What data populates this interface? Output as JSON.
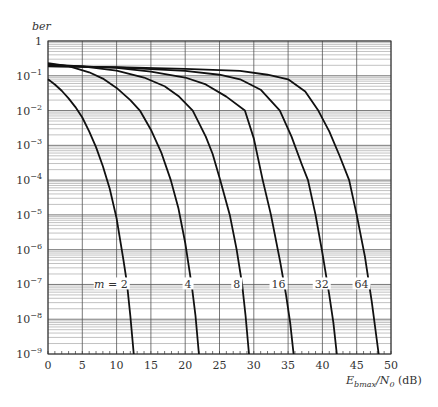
{
  "chart_data": {
    "type": "line",
    "title": "",
    "xlabel": "E_bmax/N_0 (dB)",
    "ylabel": "ber",
    "xscale": "linear",
    "yscale": "log",
    "xlim": [
      0,
      50
    ],
    "ylim": [
      1e-09,
      1
    ],
    "grid": true,
    "x_ticks": [
      0,
      5,
      10,
      15,
      20,
      25,
      30,
      35,
      40,
      45,
      50
    ],
    "y_ticks": [
      "1",
      "10^-1",
      "10^-2",
      "10^-3",
      "10^-4",
      "10^-5",
      "10^-6",
      "10^-7",
      "10^-8",
      "10^-9"
    ],
    "legend": "inline labels at ber = 10^-7",
    "series": [
      {
        "name": "m = 2",
        "label": "m = 2",
        "label_x": 12.5,
        "points": [
          [
            0,
            -1.1
          ],
          [
            1,
            -1.25
          ],
          [
            2,
            -1.43
          ],
          [
            3,
            -1.65
          ],
          [
            4,
            -1.9
          ],
          [
            5,
            -2.2
          ],
          [
            6,
            -2.6
          ],
          [
            7,
            -3.05
          ],
          [
            8,
            -3.6
          ],
          [
            9,
            -4.25
          ],
          [
            10,
            -5.1
          ],
          [
            11,
            -6.3
          ],
          [
            11.5,
            -6.95
          ],
          [
            12,
            -7.9
          ],
          [
            12.5,
            -9
          ]
        ]
      },
      {
        "name": "m = 4",
        "label": "4",
        "label_x": 21.8,
        "points": [
          [
            0,
            -0.64
          ],
          [
            3,
            -0.72
          ],
          [
            6,
            -0.9
          ],
          [
            8,
            -1.08
          ],
          [
            10,
            -1.35
          ],
          [
            12,
            -1.7
          ],
          [
            13.4,
            -2.0
          ],
          [
            15,
            -2.55
          ],
          [
            16.5,
            -3.2
          ],
          [
            17.9,
            -4.0
          ],
          [
            19,
            -4.8
          ],
          [
            20,
            -5.8
          ],
          [
            21,
            -7.1
          ],
          [
            21.5,
            -7.9
          ],
          [
            22,
            -9
          ]
        ]
      },
      {
        "name": "m = 8",
        "label": "8",
        "label_x": 28.9,
        "points": [
          [
            0,
            -0.67
          ],
          [
            5,
            -0.73
          ],
          [
            10,
            -0.85
          ],
          [
            14,
            -1.05
          ],
          [
            17,
            -1.3
          ],
          [
            19,
            -1.58
          ],
          [
            21.1,
            -2.0
          ],
          [
            23,
            -2.75
          ],
          [
            24,
            -3.25
          ],
          [
            25.1,
            -4.0
          ],
          [
            26.5,
            -5.0
          ],
          [
            27.5,
            -6.0
          ],
          [
            28.3,
            -7.0
          ],
          [
            28.8,
            -7.9
          ],
          [
            29.3,
            -9
          ]
        ]
      },
      {
        "name": "m = 16",
        "label": "16",
        "label_x": 35.5,
        "points": [
          [
            0,
            -0.7
          ],
          [
            5,
            -0.73
          ],
          [
            10,
            -0.77
          ],
          [
            15,
            -0.88
          ],
          [
            20,
            -1.05
          ],
          [
            23,
            -1.25
          ],
          [
            26,
            -1.6
          ],
          [
            28.7,
            -2.0
          ],
          [
            30,
            -2.8
          ],
          [
            31.3,
            -4.0
          ],
          [
            32.5,
            -5.0
          ],
          [
            33.8,
            -6.3
          ],
          [
            34.7,
            -7.3
          ],
          [
            35.3,
            -8.1
          ],
          [
            35.8,
            -9
          ]
        ]
      },
      {
        "name": "m = 32",
        "label": "32",
        "label_x": 41.8,
        "points": [
          [
            0,
            -0.72
          ],
          [
            10,
            -0.76
          ],
          [
            20,
            -0.86
          ],
          [
            25,
            -0.97
          ],
          [
            28,
            -1.1
          ],
          [
            31,
            -1.4
          ],
          [
            33.8,
            -2.0
          ],
          [
            35.5,
            -2.75
          ],
          [
            37,
            -3.55
          ],
          [
            37.9,
            -4.0
          ],
          [
            39,
            -5.0
          ],
          [
            40,
            -6.1
          ],
          [
            41,
            -7.3
          ],
          [
            41.6,
            -8.1
          ],
          [
            42.1,
            -9
          ]
        ]
      },
      {
        "name": "m = 64",
        "label": "64",
        "label_x": 47.6,
        "points": [
          [
            0,
            -0.73
          ],
          [
            10,
            -0.75
          ],
          [
            20,
            -0.8
          ],
          [
            28,
            -0.86
          ],
          [
            32,
            -0.97
          ],
          [
            35,
            -1.1
          ],
          [
            37.5,
            -1.45
          ],
          [
            39.4,
            -2.0
          ],
          [
            41,
            -2.6
          ],
          [
            42.5,
            -3.3
          ],
          [
            43.9,
            -4.0
          ],
          [
            45,
            -5.0
          ],
          [
            46.2,
            -6.2
          ],
          [
            47.2,
            -7.5
          ],
          [
            48.2,
            -9
          ]
        ]
      }
    ]
  },
  "axes": {
    "ylabel_text": "ber",
    "xlabel_main": "E",
    "xlabel_sub": "bmax",
    "xlabel_rest": "/N",
    "xlabel_sub2": "0",
    "xlabel_unit": " (dB)"
  }
}
